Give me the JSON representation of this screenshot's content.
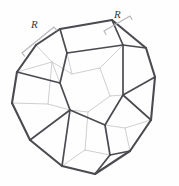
{
  "figure": {
    "shape_name": "truncated-octahedron",
    "background_color": "#fefefe",
    "edge_color": "#4a4a50",
    "hidden_edge_color": "#c9c9cf",
    "brace_color": "#b4b4bc",
    "labels": [
      {
        "id": "R-left",
        "text": "R"
      },
      {
        "id": "R-right",
        "text": "R"
      }
    ],
    "geometry": {
      "silhouette": [
        [
          60,
          29
        ],
        [
          112,
          20
        ],
        [
          146,
          48
        ],
        [
          155,
          77
        ],
        [
          151,
          120
        ],
        [
          130,
          151
        ],
        [
          95,
          174
        ],
        [
          62,
          166
        ],
        [
          30,
          140
        ],
        [
          12,
          103
        ],
        [
          17,
          72
        ],
        [
          36,
          45
        ]
      ],
      "outer_edges": [
        [
          [
            60,
            29
          ],
          [
            112,
            20
          ]
        ],
        [
          [
            112,
            20
          ],
          [
            146,
            48
          ]
        ],
        [
          [
            146,
            48
          ],
          [
            155,
            77
          ]
        ],
        [
          [
            155,
            77
          ],
          [
            151,
            120
          ]
        ],
        [
          [
            151,
            120
          ],
          [
            130,
            151
          ]
        ],
        [
          [
            130,
            151
          ],
          [
            95,
            174
          ]
        ],
        [
          [
            95,
            174
          ],
          [
            62,
            166
          ]
        ],
        [
          [
            62,
            166
          ],
          [
            30,
            140
          ]
        ],
        [
          [
            30,
            140
          ],
          [
            12,
            103
          ]
        ],
        [
          [
            12,
            103
          ],
          [
            17,
            72
          ]
        ],
        [
          [
            17,
            72
          ],
          [
            36,
            45
          ]
        ],
        [
          [
            36,
            45
          ],
          [
            60,
            29
          ]
        ]
      ],
      "front_edges": [
        [
          [
            60,
            29
          ],
          [
            67,
            53
          ]
        ],
        [
          [
            112,
            20
          ],
          [
            123,
            45
          ]
        ],
        [
          [
            67,
            53
          ],
          [
            123,
            45
          ]
        ],
        [
          [
            67,
            53
          ],
          [
            60,
            83
          ]
        ],
        [
          [
            60,
            83
          ],
          [
            17,
            72
          ]
        ],
        [
          [
            60,
            83
          ],
          [
            70,
            110
          ]
        ],
        [
          [
            70,
            110
          ],
          [
            30,
            140
          ]
        ],
        [
          [
            70,
            110
          ],
          [
            105,
            125
          ]
        ],
        [
          [
            105,
            125
          ],
          [
            123,
            95
          ]
        ],
        [
          [
            123,
            95
          ],
          [
            123,
            45
          ]
        ],
        [
          [
            123,
            95
          ],
          [
            155,
            77
          ]
        ],
        [
          [
            105,
            125
          ],
          [
            110,
            155
          ]
        ],
        [
          [
            110,
            155
          ],
          [
            130,
            151
          ]
        ],
        [
          [
            110,
            155
          ],
          [
            95,
            174
          ]
        ],
        [
          [
            70,
            110
          ],
          [
            62,
            166
          ]
        ],
        [
          [
            146,
            48
          ],
          [
            123,
            45
          ]
        ],
        [
          [
            151,
            120
          ],
          [
            123,
            95
          ]
        ]
      ],
      "hidden_edges": [
        [
          [
            36,
            45
          ],
          [
            52,
            62
          ]
        ],
        [
          [
            52,
            62
          ],
          [
            60,
            83
          ]
        ],
        [
          [
            52,
            62
          ],
          [
            72,
            74
          ]
        ],
        [
          [
            72,
            74
          ],
          [
            67,
            53
          ]
        ],
        [
          [
            72,
            74
          ],
          [
            100,
            68
          ]
        ],
        [
          [
            100,
            68
          ],
          [
            123,
            45
          ]
        ],
        [
          [
            100,
            68
          ],
          [
            110,
            96
          ]
        ],
        [
          [
            110,
            96
          ],
          [
            123,
            95
          ]
        ],
        [
          [
            110,
            96
          ],
          [
            88,
            112
          ]
        ],
        [
          [
            88,
            112
          ],
          [
            70,
            110
          ]
        ],
        [
          [
            12,
            103
          ],
          [
            48,
            104
          ]
        ],
        [
          [
            48,
            104
          ],
          [
            70,
            110
          ]
        ],
        [
          [
            48,
            104
          ],
          [
            52,
            62
          ]
        ],
        [
          [
            62,
            166
          ],
          [
            85,
            150
          ]
        ],
        [
          [
            85,
            150
          ],
          [
            110,
            155
          ]
        ],
        [
          [
            85,
            150
          ],
          [
            88,
            112
          ]
        ],
        [
          [
            17,
            72
          ],
          [
            52,
            62
          ]
        ],
        [
          [
            130,
            151
          ],
          [
            125,
            128
          ]
        ],
        [
          [
            125,
            128
          ],
          [
            105,
            125
          ]
        ],
        [
          [
            125,
            128
          ],
          [
            151,
            120
          ]
        ]
      ],
      "braces": [
        {
          "id": "brace-left",
          "from": [
            22,
            53
          ],
          "to": [
            54,
            27
          ],
          "tick": 4
        },
        {
          "id": "brace-right",
          "from": [
            104,
            31
          ],
          "to": [
            130,
            16
          ],
          "tick": 4
        }
      ]
    }
  }
}
